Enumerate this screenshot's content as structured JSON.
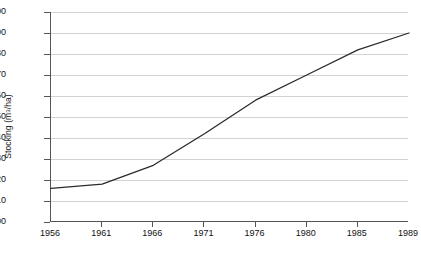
{
  "chart_data": {
    "type": "line",
    "title": "",
    "xlabel": "",
    "ylabel": "Stocking (m3/ha)",
    "ylabel_parts": {
      "prefix": "Stocking (m",
      "superscript": "3",
      "suffix": "/ha)"
    },
    "categories": [
      "1956",
      "1961",
      "1966",
      "1971",
      "1976",
      "1980",
      "1985",
      "1989"
    ],
    "x": [
      1956,
      1961,
      1966,
      1971,
      1976,
      1980,
      1985,
      1989
    ],
    "values": [
      116,
      118,
      127,
      142,
      158,
      170,
      182,
      190
    ],
    "series": [
      {
        "name": "Stocking",
        "values": [
          116,
          118,
          127,
          142,
          158,
          170,
          182,
          190
        ],
        "color": "#2b2b2b"
      }
    ],
    "ylim": [
      100,
      200
    ],
    "yticks": [
      100,
      110,
      120,
      130,
      140,
      150,
      160,
      170,
      180,
      190,
      200
    ],
    "ytick_labels": [
      "100",
      "110",
      "120",
      "130",
      "140",
      "150",
      "160",
      "170",
      "180",
      "190",
      "200"
    ],
    "xtick_labels": [
      "1956",
      "1961",
      "1966",
      "1971",
      "1976",
      "1980",
      "1985",
      "1989"
    ],
    "grid": true,
    "grid_axis": "y",
    "legend": false,
    "legend_position": "none",
    "axis_color": "#555555",
    "grid_color": "#d2d2d2",
    "background": "#ffffff"
  }
}
